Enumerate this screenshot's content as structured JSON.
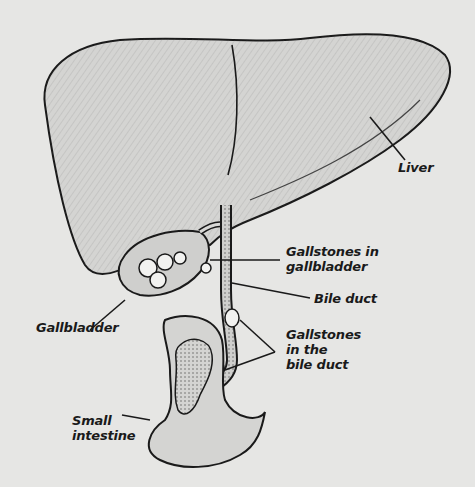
{
  "diagram": {
    "colors": {
      "background": "#e6e6e4",
      "ink": "#1a1a1a",
      "organ_fill": "#d4d4d2",
      "stone_fill": "#f2f2f0"
    },
    "labels": {
      "liver": "Liver",
      "gallstones_gallbladder": "Gallstones in\ngallbladder",
      "bile_duct": "Bile duct",
      "gallstones_bile_duct": "Gallstones\nin the\nbile duct",
      "gallbladder": "Gallbladder",
      "small_intestine": "Small\nintestine"
    }
  }
}
